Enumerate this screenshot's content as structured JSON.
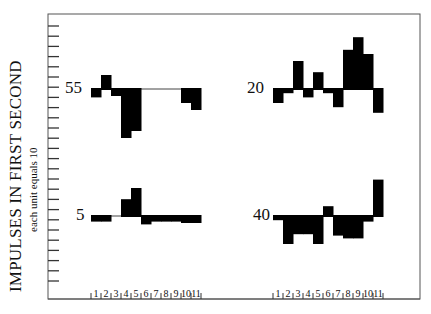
{
  "ylabel": {
    "main": "IMPULSES IN FIRST SECOND",
    "sub": "each unit equals 10"
  },
  "xticks": [
    "1",
    "2",
    "3",
    "4",
    "5",
    "6",
    "7",
    "8",
    "9",
    "10",
    "11"
  ],
  "chart_data": {
    "type": "bar",
    "title": "",
    "ylabel": "IMPULSES IN FIRST SECOND (each unit equals 10)",
    "xlabel": "",
    "categories": [
      "1",
      "2",
      "3",
      "4",
      "5",
      "6",
      "7",
      "8",
      "9",
      "10",
      "11"
    ],
    "grid": false,
    "panels": [
      {
        "label": "55",
        "position": "top-left",
        "values": [
          -0.6,
          1.0,
          -0.5,
          -3.5,
          -3.0,
          0,
          0,
          0,
          0,
          -1.0,
          -1.5
        ]
      },
      {
        "label": "20",
        "position": "top-right",
        "values": [
          -1.0,
          -0.3,
          2.0,
          -0.6,
          1.2,
          -0.3,
          -1.3,
          2.8,
          3.7,
          2.5,
          -1.7
        ]
      },
      {
        "label": "5",
        "position": "bottom-left",
        "values": [
          -0.4,
          -0.4,
          0,
          1.2,
          2.0,
          -0.6,
          -0.4,
          -0.4,
          -0.4,
          -0.5,
          -0.5
        ]
      },
      {
        "label": "40",
        "position": "bottom-right",
        "values": [
          -0.3,
          -2.0,
          -1.3,
          -1.3,
          -2.0,
          0.7,
          -1.4,
          -1.6,
          -1.6,
          -0.4,
          2.6
        ]
      }
    ]
  }
}
